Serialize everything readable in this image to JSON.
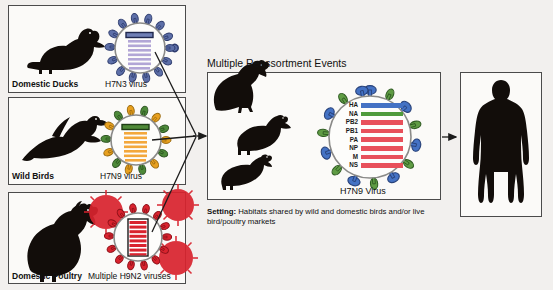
{
  "diagram": {
    "title": "Multiple Reassortment Events",
    "setting_label": "Setting:",
    "setting_text": " Habitats shared by wild and domestic birds and/or live bird/poultry markets"
  },
  "sources": [
    {
      "id": "domestic-ducks",
      "animal_label": "Domestic Ducks",
      "virus_label": "H7N3 virus",
      "animal_icon": "duck-silhouette-icon",
      "virus_icon": "virus-particle-icon",
      "spike_color": "#3f4f86",
      "segment_color": "#b2a6d6",
      "highlight_color": "#2f3f78",
      "segments": 8
    },
    {
      "id": "wild-birds",
      "animal_label": "Wild Birds",
      "virus_label": "H7N9 virus",
      "animal_icon": "flying-bird-silhouette-icon",
      "virus_icon": "virus-particle-icon",
      "spike_color": "#e8a01f",
      "spike_color_alt": "#4d8a3a",
      "segment_color": "#f3a83c",
      "highlight_color": "#3d7a2d",
      "segments": 8
    },
    {
      "id": "domestic-poultry",
      "animal_label": "Domestic Poultry",
      "virus_label": "Multiple H9N2 viruses",
      "animal_icon": "chicken-silhouette-icon",
      "virus_icon": "virus-particle-icon",
      "spike_color": "#d9232e",
      "segment_color": "#d9232e",
      "highlight_color": "#b0171f",
      "segments": 8
    }
  ],
  "middle": {
    "birds": [
      {
        "icon": "chicken-silhouette-icon",
        "name": "chicken"
      },
      {
        "icon": "duck-silhouette-icon",
        "name": "duck"
      },
      {
        "icon": "quail-silhouette-icon",
        "name": "quail"
      }
    ],
    "virus_label": "H7N9 Virus",
    "gene_segments": [
      {
        "name": "HA",
        "color": "#4472c4"
      },
      {
        "name": "NA",
        "color": "#4f9b3c"
      },
      {
        "name": "PB2",
        "color": "#e8505a"
      },
      {
        "name": "PB1",
        "color": "#e8505a"
      },
      {
        "name": "PA",
        "color": "#e8505a"
      },
      {
        "name": "NP",
        "color": "#e8505a"
      },
      {
        "name": "M",
        "color": "#e8505a"
      },
      {
        "name": "NS",
        "color": "#e8505a"
      }
    ],
    "spike_ha_color": "#4472c4",
    "spike_na_color": "#5f9c44"
  },
  "host": {
    "icon": "human-silhouette-icon",
    "name": "human-host"
  },
  "colors": {
    "panel_border": "#4b4b4b",
    "background": "#f2f0ee",
    "panel_fill": "#fbfaf8",
    "arrow": "#1b1b1b",
    "silhouette": "#120d0a"
  }
}
